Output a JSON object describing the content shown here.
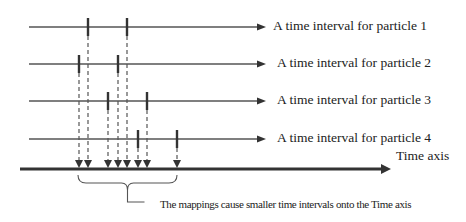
{
  "diagram": {
    "colors": {
      "line": "#555555",
      "tick": "#333333",
      "axis": "#333333",
      "dash": "#555555",
      "text": "#222222"
    },
    "rows": [
      {
        "label": "A time interval for particle 1",
        "y": 27,
        "ticks": [
          88,
          127
        ]
      },
      {
        "label": "A time interval for particle 2",
        "y": 64,
        "ticks": [
          79,
          118
        ]
      },
      {
        "label": "A time interval for particle 3",
        "y": 101,
        "ticks": [
          108,
          147
        ]
      },
      {
        "label": "A time interval for particle 4",
        "y": 139,
        "ticks": [
          138,
          177
        ]
      }
    ],
    "time_axis": {
      "label": "Time axis",
      "y": 169,
      "x_start": 20,
      "x_end": 391
    },
    "mapped_points": [
      79,
      88,
      108,
      118,
      127,
      138,
      147,
      177
    ],
    "brace": {
      "x_start": 78,
      "x_end": 177,
      "label": "The mappings cause smaller time intervals onto the Time axis"
    }
  }
}
